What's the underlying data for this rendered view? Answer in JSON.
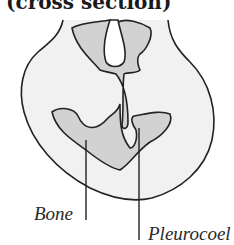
{
  "diagram": {
    "title": "(cross section)",
    "labels": {
      "bone": "Bone",
      "pleurocoel": "Pleurocoel"
    },
    "colors": {
      "outline": "#222222",
      "outer_fill": "#f1f1f1",
      "bone_fill": "#d2d2d2",
      "cavity_fill": "#ffffff"
    }
  }
}
